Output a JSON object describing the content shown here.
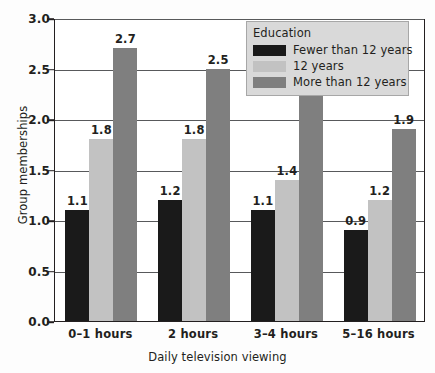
{
  "chart_data": {
    "type": "bar",
    "title": "",
    "xlabel": "Daily television viewing",
    "ylabel": "Group memberships",
    "categories": [
      "0–1 hours",
      "2 hours",
      "3–4 hours",
      "5–16 hours"
    ],
    "series": [
      {
        "name": "Fewer than 12 years",
        "color": "#1a1a1a",
        "values": [
          1.1,
          1.2,
          1.1,
          0.9
        ]
      },
      {
        "name": "12 years",
        "color": "#c2c2c2",
        "values": [
          1.8,
          1.8,
          1.4,
          1.2
        ]
      },
      {
        "name": "More than 12 years",
        "color": "#7f7f7f",
        "values": [
          2.7,
          2.5,
          2.3,
          1.9
        ]
      }
    ],
    "ylim": [
      0.0,
      3.0
    ],
    "yticks": [
      "0.0",
      "0.5",
      "1.0",
      "1.5",
      "2.0",
      "2.5",
      "3.0"
    ],
    "ytick_values": [
      0.0,
      0.5,
      1.0,
      1.5,
      2.0,
      2.5,
      3.0
    ],
    "grid": true,
    "legend": {
      "title": "Education",
      "position": "top-right"
    },
    "value_labels": [
      [
        "1.1",
        "1.8",
        "2.7"
      ],
      [
        "1.2",
        "1.8",
        "2.5"
      ],
      [
        "1.1",
        "1.4",
        "2.3"
      ],
      [
        "0.9",
        "1.2",
        "1.9"
      ]
    ]
  },
  "colors": {
    "background": "#fdfdfd",
    "plot_background": "#ffffff",
    "axis": "#231f20",
    "gridline": "#58595b",
    "legend_background": "#d9d9d9",
    "legend_border": "#a7a7a7",
    "text": "#231f20"
  }
}
